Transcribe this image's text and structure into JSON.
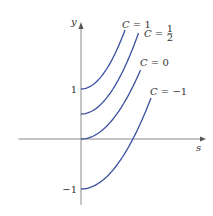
{
  "chart_data": {
    "type": "line",
    "title": "",
    "xlabel": "s",
    "ylabel": "y",
    "x_ticks": [],
    "y_ticks": [
      {
        "value": 1,
        "label": "1"
      },
      {
        "value": -1,
        "label": "−1"
      }
    ],
    "xlim": [
      -1.25,
      2.4
    ],
    "ylim": [
      -1.3,
      2.3
    ],
    "grid": false,
    "legend": "none",
    "series": [
      {
        "name": "C = 1",
        "C": 1,
        "label_var": "C",
        "label_eq": "=",
        "label_val": "1",
        "s_end": 0.88,
        "y_end": 2.18
      },
      {
        "name": "C = 1/2",
        "C": 0.5,
        "label_var": "C",
        "label_eq": "=",
        "label_num": "1",
        "label_den": "2",
        "s_end": 1.15,
        "y_end": 2.12
      },
      {
        "name": "C = 0",
        "C": 0,
        "label_var": "C",
        "label_eq": "=",
        "label_val": "0",
        "s_end": 1.19,
        "y_end": 1.38
      },
      {
        "name": "C = −1",
        "C": -1,
        "label_var": "C",
        "label_eq": "=",
        "label_val": "−1",
        "s_end": 1.4,
        "y_end": 0.82
      }
    ]
  }
}
